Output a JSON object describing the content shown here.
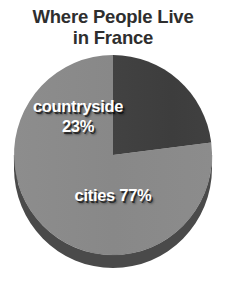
{
  "chart_data": {
    "type": "pie",
    "title": "Where People Live\nin France",
    "title_line1": "Where People Live",
    "title_line2": "in France",
    "categories": [
      "countryside",
      "cities"
    ],
    "values": [
      23,
      77
    ],
    "unit": "%",
    "labels": [
      "countryside\n23%",
      "cities 77%"
    ],
    "colors": [
      "#3f3f3f",
      "#8a8a8a"
    ],
    "side_colors": [
      "#2c2c2c",
      "#4a4a4a"
    ],
    "background": "#ffffff",
    "title_color": "#2e2e2e",
    "label_color": "#ffffff",
    "start_angle_deg": 90,
    "direction": "counterclockwise",
    "three_d": true,
    "legend": "none",
    "grid": false,
    "xlabel": "",
    "ylabel": ""
  },
  "slices": [
    {
      "name": "countryside",
      "label_text": "countryside\n23%",
      "value": 23,
      "color": "#3f3f3f"
    },
    {
      "name": "cities",
      "label_text": "cities 77%",
      "value": 77,
      "color": "#8a8a8a"
    }
  ]
}
